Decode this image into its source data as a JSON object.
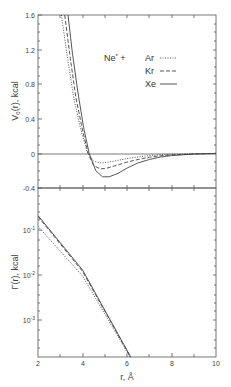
{
  "chart_data": [
    {
      "type": "line",
      "panel": "top",
      "title": "",
      "xlabel": "",
      "ylabel": "V0(r), kcal",
      "ylabel_main": "V",
      "ylabel_sub": "0",
      "ylabel_rest": "(r), kcal",
      "xlim": [
        2,
        10
      ],
      "ylim": [
        -0.4,
        1.6
      ],
      "yticks": [
        "1.6",
        "1.2",
        "0.8",
        "0.4",
        "0",
        "-0.4"
      ],
      "ytick_values": [
        1.6,
        1.2,
        0.8,
        0.4,
        0,
        -0.4
      ],
      "grid": false,
      "legend": {
        "prefix": "Ne* + ",
        "prefix_main": "Ne",
        "prefix_sup": "*",
        "prefix_rest": " +",
        "entries": [
          {
            "name": "Ar",
            "style": "dotted"
          },
          {
            "name": "Kr",
            "style": "dashed"
          },
          {
            "name": "Xe",
            "style": "solid"
          }
        ],
        "position": "upper right"
      },
      "series": [
        {
          "name": "Ne* + Ar",
          "style": "dotted",
          "x": [
            3.05,
            3.3,
            3.6,
            3.9,
            4.2,
            4.5,
            4.8,
            5.2,
            5.6,
            6.0,
            6.5,
            7.0,
            7.5,
            8.0,
            9.0,
            10.0
          ],
          "y": [
            1.6,
            1.15,
            0.65,
            0.3,
            0.02,
            -0.09,
            -0.11,
            -0.1,
            -0.08,
            -0.06,
            -0.04,
            -0.025,
            -0.015,
            -0.01,
            -0.004,
            0.0
          ]
        },
        {
          "name": "Ne* + Kr",
          "style": "dashed",
          "x": [
            3.2,
            3.45,
            3.7,
            4.0,
            4.25,
            4.5,
            4.8,
            5.1,
            5.5,
            6.0,
            6.5,
            7.0,
            7.5,
            8.0,
            9.0,
            10.0
          ],
          "y": [
            1.6,
            1.1,
            0.65,
            0.27,
            0.0,
            -0.14,
            -0.18,
            -0.17,
            -0.14,
            -0.1,
            -0.07,
            -0.045,
            -0.028,
            -0.017,
            -0.006,
            0.0
          ]
        },
        {
          "name": "Ne* + Xe",
          "style": "solid",
          "x": [
            3.35,
            3.55,
            3.8,
            4.05,
            4.3,
            4.6,
            4.9,
            5.2,
            5.6,
            6.0,
            6.5,
            7.0,
            7.5,
            8.0,
            9.0,
            10.0
          ],
          "y": [
            1.6,
            1.15,
            0.7,
            0.3,
            0.0,
            -0.2,
            -0.27,
            -0.27,
            -0.23,
            -0.17,
            -0.11,
            -0.07,
            -0.042,
            -0.025,
            -0.008,
            0.0
          ]
        }
      ]
    },
    {
      "type": "line",
      "panel": "bottom",
      "title": "",
      "xlabel": "r, Å",
      "ylabel": "Γ(r), kcal",
      "yscale": "log",
      "xlim": [
        2,
        10
      ],
      "ylim": [
        5e-05,
        1
      ],
      "xticks": [
        "2",
        "4",
        "6",
        "8",
        "10"
      ],
      "xtick_values": [
        2,
        4,
        6,
        8,
        10
      ],
      "yticks": [
        "10⁻¹",
        "10⁻²",
        "10⁻³"
      ],
      "ytick_labels_main": [
        "10",
        "10",
        "10"
      ],
      "ytick_labels_exp": [
        "-1",
        "-2",
        "-3"
      ],
      "ytick_values": [
        0.1,
        0.01,
        0.001
      ],
      "grid": false,
      "series": [
        {
          "name": "Ne* + Ar",
          "style": "dotted",
          "x": [
            2.0,
            4.0,
            6.7
          ],
          "y": [
            0.12,
            0.0095,
            5e-05
          ]
        },
        {
          "name": "Ne* + Kr",
          "style": "dashed",
          "x": [
            2.0,
            4.0,
            6.7
          ],
          "y": [
            0.2,
            0.012,
            5e-05
          ]
        },
        {
          "name": "Ne* + Xe",
          "style": "solid",
          "x": [
            2.0,
            4.0,
            6.7
          ],
          "y": [
            0.21,
            0.013,
            5e-05
          ]
        }
      ]
    }
  ],
  "colors": {
    "axis": "#555555",
    "line": "#444444",
    "background": "#ffffff"
  }
}
